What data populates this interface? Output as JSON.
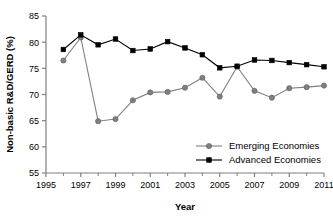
{
  "chart_data": {
    "type": "line",
    "title": "",
    "xlabel": "Year",
    "ylabel": "Non-basic R&D/GERD (%)",
    "xlim": [
      1995,
      2011
    ],
    "ylim": [
      55,
      85
    ],
    "x_tick_labels": [
      "1995",
      "1997",
      "1999",
      "2001",
      "2003",
      "2005",
      "2007",
      "2009",
      "2011"
    ],
    "x_tick_values": [
      1995,
      1997,
      1999,
      2001,
      2003,
      2005,
      2007,
      2009,
      2011
    ],
    "x_minor_ticks": [
      1996,
      1998,
      2000,
      2002,
      2004,
      2006,
      2008,
      2010
    ],
    "y_tick_labels": [
      "55",
      "60",
      "65",
      "70",
      "75",
      "80",
      "85"
    ],
    "y_tick_values": [
      55,
      60,
      65,
      70,
      75,
      80,
      85
    ],
    "grid": false,
    "legend_position": "lower right",
    "x": [
      1996,
      1997,
      1998,
      1999,
      2000,
      2001,
      2002,
      2003,
      2004,
      2005,
      2006,
      2007,
      2008,
      2009,
      2010,
      2011
    ],
    "series": [
      {
        "name": "Emerging Economies",
        "color": "#808080",
        "marker": "circle",
        "values": [
          76.5,
          80.9,
          64.9,
          65.3,
          68.9,
          70.4,
          70.5,
          71.3,
          73.2,
          69.6,
          75.3,
          70.7,
          69.4,
          71.2,
          71.4,
          71.7
        ]
      },
      {
        "name": "Advanced Economies",
        "color": "#000000",
        "marker": "square",
        "values": [
          78.6,
          81.4,
          79.5,
          80.6,
          78.4,
          78.7,
          80.1,
          78.9,
          77.6,
          75.1,
          75.4,
          76.6,
          76.5,
          76.1,
          75.7,
          75.3
        ]
      }
    ]
  },
  "legend": {
    "items": [
      {
        "label": "Emerging Economies"
      },
      {
        "label": "Advanced Economies"
      }
    ]
  },
  "axes": {
    "x_axis_title": "Year",
    "y_axis_title": "Non-basic R&D/GERD (%)"
  }
}
